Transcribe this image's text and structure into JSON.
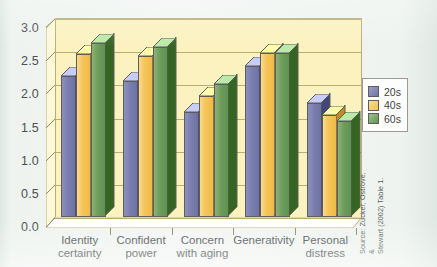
{
  "figure": {
    "background_color": "#eef3ef",
    "plot_background_color": "#fbf2bf",
    "source_note": "Source: Zucker, Ostrove, &\nStewart (2002) Table 1."
  },
  "legend": {
    "position": "right",
    "entries": [
      {
        "label": "20s",
        "color": "#7b7fae"
      },
      {
        "label": "40s",
        "color": "#f6c65a"
      },
      {
        "label": "60s",
        "color": "#6d9d5a"
      }
    ]
  },
  "chart_data": {
    "type": "bar",
    "title": "",
    "subtitle": "",
    "xlabel": "",
    "ylabel": "",
    "ylim": [
      0.0,
      3.0
    ],
    "ytick_labels": [
      "0.0",
      "0.5",
      "1.0",
      "1.5",
      "2.0",
      "2.5",
      "3.0"
    ],
    "ytick_values": [
      0.0,
      0.5,
      1.0,
      1.5,
      2.0,
      2.5,
      3.0
    ],
    "grid": true,
    "grid_axis": "y",
    "three_d": true,
    "legend_position": "right",
    "categories": [
      "Identity\ncertainty",
      "Confident\npower",
      "Concern\nwith aging",
      "Generativity",
      "Personal\ndistress"
    ],
    "series": [
      {
        "name": "20s",
        "color": "#7b7fae",
        "values": [
          2.12,
          2.05,
          1.58,
          2.27,
          1.72
        ]
      },
      {
        "name": "40s",
        "color": "#f6c65a",
        "values": [
          2.46,
          2.43,
          1.82,
          2.47,
          1.54
        ]
      },
      {
        "name": "60s",
        "color": "#6d9d5a",
        "values": [
          2.62,
          2.57,
          2.0,
          2.47,
          1.45
        ]
      }
    ],
    "annotations": [
      "Source: Zucker, Ostrove, & Stewart (2002) Table 1."
    ]
  }
}
